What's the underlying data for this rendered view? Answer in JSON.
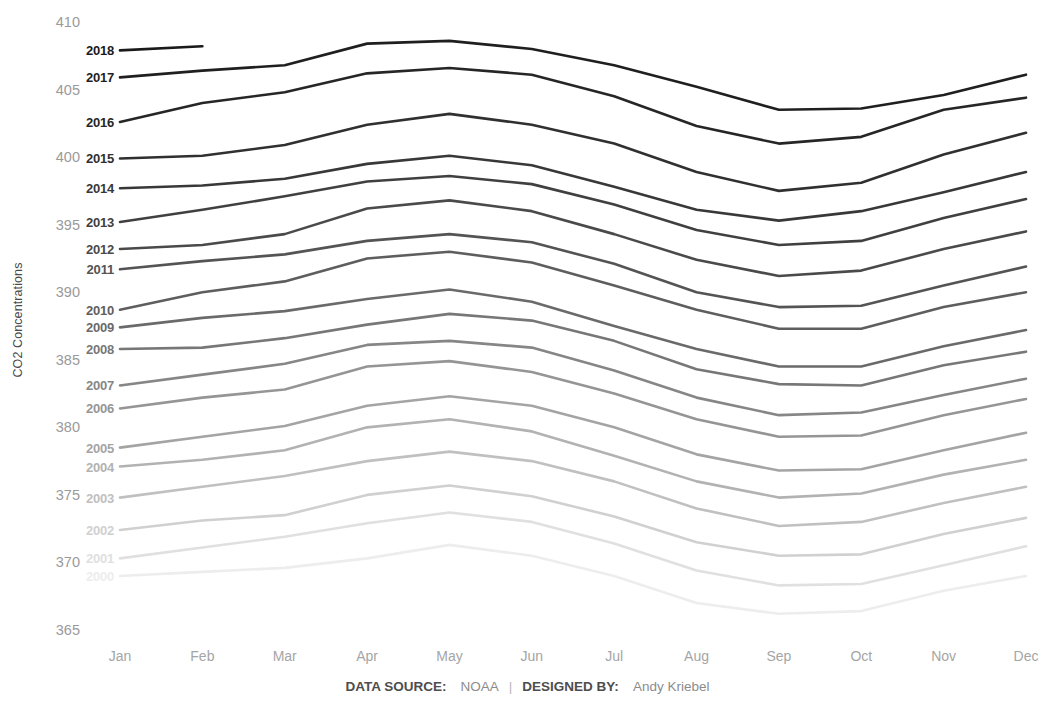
{
  "axes": {
    "y_title": "CO2 Concentrations",
    "y_ticks": [
      "410",
      "405",
      "400",
      "395",
      "390",
      "385",
      "380",
      "375",
      "370",
      "365"
    ],
    "x_ticks": [
      "Jan",
      "Feb",
      "Mar",
      "Apr",
      "May",
      "Jun",
      "Jul",
      "Aug",
      "Sep",
      "Oct",
      "Nov",
      "Dec"
    ]
  },
  "footer": {
    "source_label": "DATA SOURCE:",
    "source_value": "NOAA",
    "separator": "|",
    "designer_label": "DESIGNED BY:",
    "designer_value": "Andy Kriebel"
  },
  "chart_data": {
    "type": "line",
    "title": "",
    "xlabel": "",
    "ylabel": "CO2 Concentrations",
    "categories": [
      "Jan",
      "Feb",
      "Mar",
      "Apr",
      "May",
      "Jun",
      "Jul",
      "Aug",
      "Sep",
      "Oct",
      "Nov",
      "Dec"
    ],
    "ylim": [
      365,
      410
    ],
    "y_ticks": [
      365,
      370,
      375,
      380,
      385,
      390,
      395,
      400,
      405,
      410
    ],
    "grid": false,
    "legend": "inline-left-labels",
    "series": [
      {
        "name": "2018",
        "color": "#1a1a1a",
        "values": [
          407.9,
          408.2,
          null,
          null,
          null,
          null,
          null,
          null,
          null,
          null,
          null,
          null
        ]
      },
      {
        "name": "2017",
        "color": "#1f1f1f",
        "values": [
          405.9,
          406.4,
          406.8,
          408.4,
          408.6,
          408.0,
          406.8,
          405.2,
          403.5,
          403.6,
          404.6,
          406.1
        ]
      },
      {
        "name": "2016",
        "color": "#262626",
        "values": [
          402.6,
          404.0,
          404.8,
          406.2,
          406.6,
          406.1,
          404.5,
          402.3,
          401.0,
          401.5,
          403.5,
          404.4
        ]
      },
      {
        "name": "2015",
        "color": "#303030",
        "values": [
          399.9,
          400.1,
          400.9,
          402.4,
          403.2,
          402.4,
          401.0,
          398.9,
          397.5,
          398.1,
          400.2,
          401.8
        ]
      },
      {
        "name": "2014",
        "color": "#383838",
        "values": [
          397.7,
          397.9,
          398.4,
          399.5,
          400.1,
          399.4,
          397.8,
          396.1,
          395.3,
          396.0,
          397.4,
          398.9
        ]
      },
      {
        "name": "2013",
        "color": "#404040",
        "values": [
          395.2,
          396.1,
          397.1,
          398.2,
          398.6,
          398.0,
          396.5,
          394.6,
          393.5,
          393.8,
          395.5,
          396.9
        ]
      },
      {
        "name": "2012",
        "color": "#4a4a4a",
        "values": [
          393.2,
          393.5,
          394.3,
          396.2,
          396.8,
          396.0,
          394.3,
          392.4,
          391.2,
          391.6,
          393.2,
          394.5
        ]
      },
      {
        "name": "2011",
        "color": "#545454",
        "values": [
          391.7,
          392.3,
          392.8,
          393.8,
          394.3,
          393.7,
          392.1,
          390.0,
          388.9,
          389.0,
          390.5,
          391.9
        ]
      },
      {
        "name": "2010",
        "color": "#5e5e5e",
        "values": [
          388.7,
          390.0,
          390.8,
          392.5,
          393.0,
          392.2,
          390.5,
          388.7,
          387.3,
          387.3,
          388.9,
          390.0
        ]
      },
      {
        "name": "2009",
        "color": "#6a6a6a",
        "values": [
          387.4,
          388.1,
          388.6,
          389.5,
          390.2,
          389.3,
          387.5,
          385.8,
          384.5,
          384.5,
          386.0,
          387.2
        ]
      },
      {
        "name": "2008",
        "color": "#777777",
        "values": [
          385.8,
          385.9,
          386.6,
          387.6,
          388.4,
          387.9,
          386.4,
          384.3,
          383.2,
          383.1,
          384.6,
          385.6
        ]
      },
      {
        "name": "2007",
        "color": "#868686",
        "values": [
          383.1,
          383.9,
          384.7,
          386.1,
          386.4,
          385.9,
          384.2,
          382.2,
          380.9,
          381.1,
          382.4,
          383.6
        ]
      },
      {
        "name": "2006",
        "color": "#959595",
        "values": [
          381.4,
          382.2,
          382.8,
          384.5,
          384.9,
          384.1,
          382.5,
          380.6,
          379.3,
          379.4,
          380.9,
          382.1
        ]
      },
      {
        "name": "2005",
        "color": "#a4a4a4",
        "values": [
          378.5,
          379.3,
          380.1,
          381.6,
          382.3,
          381.6,
          380.0,
          378.0,
          376.8,
          376.9,
          378.3,
          379.6
        ]
      },
      {
        "name": "2004",
        "color": "#b2b2b2",
        "values": [
          377.1,
          377.6,
          378.3,
          380.0,
          380.6,
          379.7,
          377.9,
          376.0,
          374.8,
          375.1,
          376.5,
          377.6
        ]
      },
      {
        "name": "2003",
        "color": "#c0c0c0",
        "values": [
          374.8,
          375.6,
          376.4,
          377.5,
          378.2,
          377.5,
          376.0,
          374.0,
          372.7,
          373.0,
          374.4,
          375.6
        ]
      },
      {
        "name": "2002",
        "color": "#d0d0d0",
        "values": [
          372.4,
          373.1,
          373.5,
          375.0,
          375.7,
          374.9,
          373.4,
          371.5,
          370.5,
          370.6,
          372.1,
          373.3
        ]
      },
      {
        "name": "2001",
        "color": "#e0e0e0",
        "values": [
          370.3,
          371.1,
          371.9,
          372.9,
          373.7,
          373.0,
          371.4,
          369.4,
          368.3,
          368.4,
          369.8,
          371.2
        ]
      },
      {
        "name": "2000",
        "color": "#ededed",
        "values": [
          369.0,
          369.3,
          369.6,
          370.3,
          371.3,
          370.5,
          369.0,
          367.0,
          366.2,
          366.4,
          367.9,
          369.0
        ]
      }
    ]
  }
}
